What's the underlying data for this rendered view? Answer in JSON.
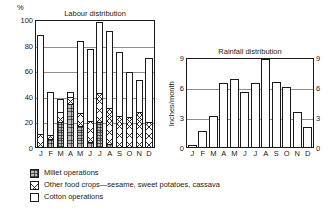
{
  "figure": {
    "background": "#ffffff",
    "ink": "#1a1a1a",
    "gridline_color": "#8d8d8d"
  },
  "labour_chart": {
    "title": "Labour distribution",
    "unit_label": "%",
    "y_ticks": [
      "0",
      "20",
      "40",
      "60",
      "80",
      "100"
    ]
  },
  "rainfall_chart": {
    "title": "Rainfall distribution",
    "axis_label": "Inches/month",
    "y_ticks": [
      "0",
      "3",
      "6",
      "9"
    ]
  },
  "legend": {
    "items": [
      {
        "key": "millet",
        "label": "Millet operations"
      },
      {
        "key": "other",
        "label": "Other food crops—sesame, sweet potatoes, cassava"
      },
      {
        "key": "cotton",
        "label": "Cotton operations"
      }
    ]
  },
  "chart_data": [
    {
      "id": "labour-distribution",
      "type": "bar",
      "stacked": true,
      "title": "Labour distribution",
      "xlabel": "",
      "ylabel": "%",
      "ylim": [
        0,
        100
      ],
      "yticks": [
        0,
        20,
        40,
        60,
        80,
        100
      ],
      "grid": true,
      "legend_position": "below-figure",
      "categories": [
        "J",
        "F",
        "M",
        "A",
        "M",
        "J",
        "J",
        "A",
        "S",
        "O",
        "N",
        "D"
      ],
      "series": [
        {
          "name": "Millet operations",
          "values": [
            0,
            7,
            20,
            34,
            17,
            5,
            20,
            3,
            0,
            0,
            0,
            0
          ]
        },
        {
          "name": "Other food crops—sesame, sweet potatoes, cassava",
          "values": [
            11,
            4,
            9,
            7,
            11,
            17,
            24,
            29,
            25,
            24,
            28,
            20
          ]
        },
        {
          "name": "Cotton operations",
          "values": [
            78,
            34,
            11,
            4,
            57,
            57,
            56,
            61,
            51,
            36,
            26,
            51
          ]
        }
      ],
      "totals": [
        89,
        45,
        40,
        45,
        85,
        79,
        100,
        93,
        76,
        60,
        54,
        71
      ]
    },
    {
      "id": "rainfall-distribution",
      "type": "bar",
      "stacked": false,
      "title": "Rainfall distribution",
      "xlabel": "",
      "ylabel": "Inches/month",
      "ylim": [
        0,
        9
      ],
      "yticks": [
        0,
        3,
        6,
        9
      ],
      "grid": true,
      "categories": [
        "J",
        "F",
        "M",
        "A",
        "M",
        "J",
        "J",
        "A",
        "S",
        "O",
        "N",
        "D"
      ],
      "values": [
        0.3,
        1.7,
        3.2,
        6.5,
        6.9,
        5.6,
        6.5,
        8.9,
        6.6,
        6.1,
        3.6,
        2.1
      ]
    }
  ]
}
